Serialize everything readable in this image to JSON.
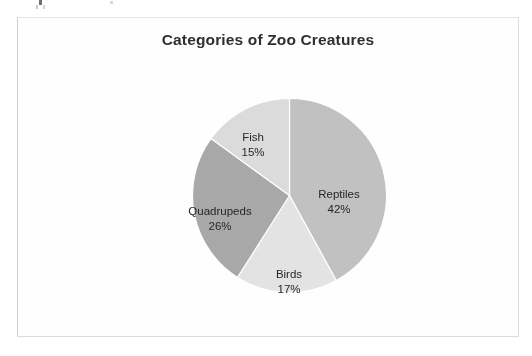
{
  "chart_data": {
    "type": "pie",
    "title": "Categories of Zoo Creatures",
    "categories": [
      "Reptiles",
      "Birds",
      "Quadrupeds",
      "Fish"
    ],
    "values": [
      42,
      17,
      26,
      15
    ],
    "value_unit": "%",
    "labels": [
      "42%",
      "17%",
      "26%",
      "15%"
    ],
    "colors": [
      "#c2c2c2",
      "#e4e4e4",
      "#a9a9a9",
      "#dcdcdc"
    ],
    "start_angle_deg": 0,
    "direction": "clockwise",
    "legend": "none",
    "data_labels": "inside-slice",
    "grid": false,
    "xlabel": "",
    "ylabel": ""
  },
  "frame": {
    "border_color": "#dcdcdc",
    "background": "#ffffff"
  },
  "slices": [
    {
      "name": "Reptiles",
      "percent_label": "42%",
      "color": "#c2c2c2"
    },
    {
      "name": "Birds",
      "percent_label": "17%",
      "color": "#e4e4e4"
    },
    {
      "name": "Quadrupeds",
      "percent_label": "26%",
      "color": "#a9a9a9"
    },
    {
      "name": "Fish",
      "percent_label": "15%",
      "color": "#dcdcdc"
    }
  ]
}
